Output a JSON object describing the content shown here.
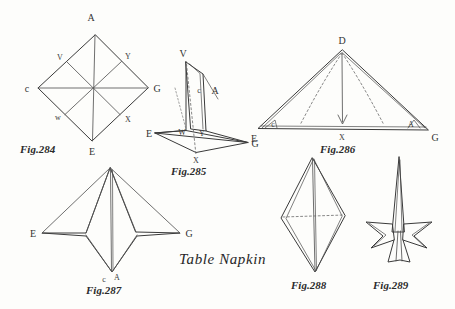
{
  "plate": {
    "title": "Table Napkin",
    "background_color": "#fdfdfb",
    "ink_color": "#3a3a3a",
    "width": 455,
    "height": 309
  },
  "figures": [
    {
      "id": "fig-284",
      "caption": "Fig.284",
      "description": "Open square napkin laid as a diamond with both diagonals and the four mid-point creases marked",
      "vertex_labels": [
        "A",
        "C",
        "G",
        "E",
        "V",
        "Y",
        "W",
        "X"
      ]
    },
    {
      "id": "fig-285",
      "caption": "Fig.285",
      "description": "Napkin partly folded into a three dimensional form with a raised flap",
      "vertex_labels": [
        "V",
        "C",
        "A",
        "W",
        "Y",
        "E",
        "G",
        "X"
      ]
    },
    {
      "id": "fig-286",
      "caption": "Fig.286",
      "description": "Triangle folded flat with apex D brought down to point X on base line E G",
      "vertex_labels": [
        "D",
        "E",
        "G",
        "X",
        "C",
        "A"
      ]
    },
    {
      "id": "fig-287",
      "caption": "Fig.287",
      "description": "Four pointed star shape with points E and G to the sides and points C and A at the base",
      "vertex_labels": [
        "E",
        "G",
        "C",
        "A"
      ]
    },
    {
      "id": "fig-288",
      "caption": "Fig.288",
      "description": "Elongated kite shaped fold seen from the side with a dotted mid line",
      "vertex_labels": []
    },
    {
      "id": "fig-289",
      "caption": "Fig.289",
      "description": "Finished table napkin standing upright with a tall spike and flared wings",
      "vertex_labels": []
    }
  ],
  "labels": {
    "fig284": {
      "A": "A",
      "C": "c",
      "G": "G",
      "E": "E",
      "V": "V",
      "Y": "Y",
      "W": "w",
      "X": "X"
    },
    "fig285": {
      "V": "V",
      "C": "c",
      "A": "A",
      "W": "W",
      "Y": "Y",
      "E": "E",
      "G": "G",
      "X": "X"
    },
    "fig286": {
      "D": "D",
      "E": "E",
      "G": "G",
      "X": "X",
      "C": "c",
      "A": "A"
    },
    "fig287": {
      "E": "E",
      "G": "G",
      "C": "c",
      "A": "A"
    }
  }
}
